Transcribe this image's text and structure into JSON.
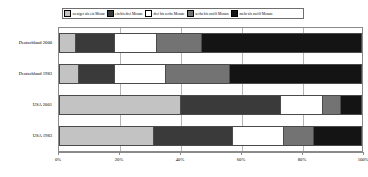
{
  "chart_data": {
    "type": "bar",
    "orientation": "horizontal",
    "stacked": true,
    "stacked_normalized": true,
    "title": "",
    "subtitle": "",
    "xlabel": "",
    "ylabel": "",
    "xlim": [
      0,
      100
    ],
    "xticks": [
      0,
      20,
      40,
      60,
      80,
      100
    ],
    "xtick_labels": [
      "0%",
      "20%",
      "40%",
      "60%",
      "80%",
      "100%"
    ],
    "grid": true,
    "grid_axis": "x",
    "legend_position": "top",
    "categories": [
      "Deutschland 2000",
      "Deutschland 1983",
      "USA 2001",
      "USA 1983"
    ],
    "series": [
      {
        "name": "weniger als ein Monat",
        "color": "#c3c3c3",
        "values": [
          5,
          6,
          40,
          31
        ]
      },
      {
        "name": "ein bis drei Monate",
        "color": "#3a3a3a",
        "values": [
          13,
          12,
          33,
          26
        ]
      },
      {
        "name": "drei bis sechs Monate",
        "color": "#ffffff",
        "values": [
          14,
          17,
          14,
          17
        ]
      },
      {
        "name": "sechs bis zwölf Monate",
        "color": "#737373",
        "values": [
          15,
          21,
          6,
          10
        ]
      },
      {
        "name": "mehr als zwölf Monate",
        "color": "#141414",
        "values": [
          53,
          44,
          7,
          16
        ]
      }
    ]
  },
  "legend": {
    "items": [
      {
        "label": "weniger als ein Monat"
      },
      {
        "label": "ein bis drei Monate"
      },
      {
        "label": "drei bis sechs Monate"
      },
      {
        "label": "sechs bis zwölf Monate"
      },
      {
        "label": "mehr als zwölf Monate"
      }
    ]
  },
  "axis": {
    "y_categories": [
      "Deutschland 2000",
      "Deutschland 1983",
      "USA 2001",
      "USA 1983"
    ],
    "x_tick_labels": [
      "0%",
      "20%",
      "40%",
      "60%",
      "80%",
      "100%"
    ]
  },
  "colors": {
    "series_1": "#c3c3c3",
    "series_2": "#3a3a3a",
    "series_3": "#ffffff",
    "series_4": "#737373",
    "series_5": "#141414",
    "grid": "#b5b5b5",
    "axis": "#8a8a8a",
    "outline": "#4a4a4a",
    "background": "#ffffff"
  }
}
